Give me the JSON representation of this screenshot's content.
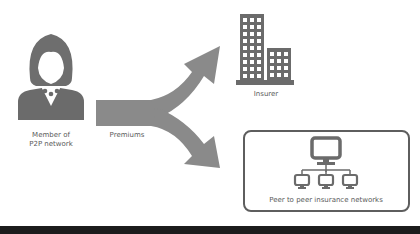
{
  "diagram": {
    "member": {
      "label_line1": "Member of",
      "label_line2": "P2P network",
      "icon": "woman-avatar-icon"
    },
    "flow": {
      "label": "Premiums",
      "icon": "split-arrow-icon"
    },
    "insurer": {
      "label": "Insurer",
      "icon": "office-buildings-icon"
    },
    "p2p": {
      "label": "Peer to peer insurance networks",
      "icon": "computer-network-icon"
    }
  },
  "colors": {
    "icon_gray": "#6b6b6b",
    "arrow_gray": "#8a8a8a",
    "text_gray": "#5a5a5a",
    "box_border": "#5e5e5e",
    "bottom_band": "#1c1c1c",
    "background": "#ffffff"
  }
}
